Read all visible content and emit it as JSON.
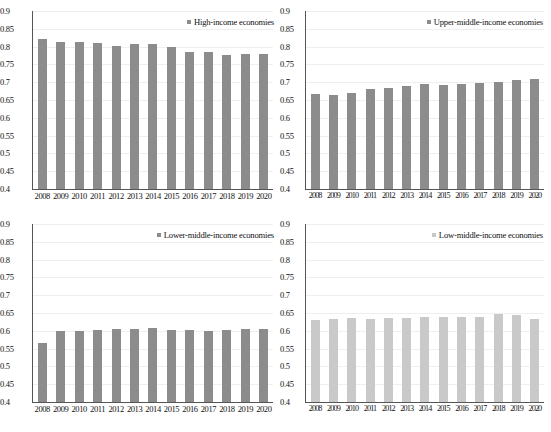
{
  "figure": {
    "type": "multi-panel-bar-chart",
    "panels": 4,
    "colors": {
      "bar_dark": "#8c8c8c",
      "bar_light": "#c9c9c9",
      "gridline": "#efefef",
      "axis": "#555555"
    }
  },
  "chart_data": [
    {
      "type": "bar",
      "panel": "top-left",
      "title": "",
      "legend": "High-income economies",
      "legend_position": "top-right",
      "xlabel": "",
      "ylabel": "",
      "grid": true,
      "ylim": [
        0.4,
        0.9
      ],
      "yticks": [
        "0.9",
        "0.85",
        "0.8",
        "0.75",
        "0.7",
        "0.65",
        "0.6",
        "0.55",
        "0.5",
        "0.45",
        "0.4"
      ],
      "categories": [
        "2008",
        "2009",
        "2010",
        "2011",
        "2012",
        "2013",
        "2014",
        "2015",
        "2016",
        "2017",
        "2018",
        "2019",
        "2020"
      ],
      "values": [
        0.822,
        0.814,
        0.814,
        0.811,
        0.803,
        0.807,
        0.806,
        0.798,
        0.784,
        0.784,
        0.777,
        0.78,
        0.779
      ],
      "color": "#8c8c8c"
    },
    {
      "type": "bar",
      "panel": "top-right",
      "title": "",
      "legend": "Upper-middle-income economies",
      "legend_position": "top-right",
      "xlabel": "",
      "ylabel": "",
      "grid": true,
      "ylim": [
        0.4,
        0.9
      ],
      "yticks": [
        "0.9",
        "0.85",
        "0.8",
        "0.75",
        "0.7",
        "0.65",
        "0.6",
        "0.55",
        "0.5",
        "0.45",
        "0.4"
      ],
      "categories": [
        "2008",
        "2009",
        "2010",
        "2011",
        "2012",
        "2013",
        "2014",
        "2015",
        "2016",
        "2017",
        "2018",
        "2019",
        "2020"
      ],
      "values": [
        0.667,
        0.664,
        0.671,
        0.68,
        0.684,
        0.689,
        0.694,
        0.692,
        0.695,
        0.699,
        0.702,
        0.705,
        0.71
      ],
      "color": "#8c8c8c"
    },
    {
      "type": "bar",
      "panel": "bottom-left",
      "title": "",
      "legend": "Lower-middle-income economies",
      "legend_position": "top-right",
      "xlabel": "",
      "ylabel": "",
      "grid": true,
      "ylim": [
        0.4,
        0.9
      ],
      "yticks": [
        "0.9",
        "0.85",
        "0.8",
        "0.75",
        "0.7",
        "0.65",
        "0.6",
        "0.55",
        "0.5",
        "0.45",
        "0.4"
      ],
      "categories": [
        "2008",
        "2009",
        "2010",
        "2011",
        "2012",
        "2013",
        "2014",
        "2015",
        "2016",
        "2017",
        "2018",
        "2019",
        "2020"
      ],
      "values": [
        0.566,
        0.599,
        0.599,
        0.603,
        0.604,
        0.606,
        0.608,
        0.603,
        0.603,
        0.6,
        0.603,
        0.605,
        0.604
      ],
      "color": "#8c8c8c"
    },
    {
      "type": "bar",
      "panel": "bottom-right",
      "title": "",
      "legend": "Low-middle-income economies",
      "legend_position": "top-right",
      "xlabel": "",
      "ylabel": "",
      "grid": true,
      "ylim": [
        0.4,
        0.9
      ],
      "yticks": [
        "0.9",
        "0.85",
        "0.8",
        "0.75",
        "0.7",
        "0.65",
        "0.6",
        "0.55",
        "0.5",
        "0.45",
        "0.4"
      ],
      "categories": [
        "2008",
        "2009",
        "2010",
        "2011",
        "2012",
        "2013",
        "2014",
        "2015",
        "2016",
        "2017",
        "2018",
        "2019",
        "2020"
      ],
      "values": [
        0.631,
        0.633,
        0.636,
        0.634,
        0.635,
        0.637,
        0.638,
        0.638,
        0.638,
        0.64,
        0.646,
        0.644,
        0.633
      ],
      "color": "#c9c9c9"
    }
  ]
}
